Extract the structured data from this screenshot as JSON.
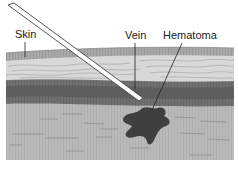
{
  "figure": {
    "labels": {
      "skin": "Skin",
      "vein": "Vein",
      "hematoma": "Hematoma"
    },
    "colors": {
      "background": "#ffffff",
      "skin_band": "#a9a9a9",
      "dermis": "#d6d6d6",
      "vein_outer": "#6e6e6e",
      "vein_inner": "#4e4e4e",
      "subcutaneous": "#b7b7b7",
      "hematoma": "#3f3f3f",
      "needle_outline": "#444444",
      "needle_fill": "#ffffff",
      "leader_line": "#222222"
    }
  }
}
